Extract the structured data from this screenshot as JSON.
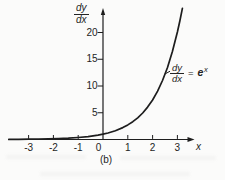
{
  "figure": {
    "caption": "(b)",
    "background": "#fbfbfa",
    "ink_color": "#1d1d1d"
  },
  "chart_data": {
    "type": "line",
    "title": "",
    "xlabel": "x",
    "ylabel_numerator": "dy",
    "ylabel_denominator": "dx",
    "x_ticks": [
      -3,
      -2,
      -1,
      0,
      1,
      2,
      3
    ],
    "y_ticks": [
      5,
      10,
      15,
      20
    ],
    "xlim": [
      -3.8,
      3.65
    ],
    "ylim": [
      0,
      24.8
    ],
    "grid": false,
    "legend": "none",
    "series": [
      {
        "name": "dy/dx = e^x",
        "points": [
          [
            -3.8,
            0.02
          ],
          [
            -3.4,
            0.03
          ],
          [
            -3.0,
            0.05
          ],
          [
            -2.6,
            0.07
          ],
          [
            -2.2,
            0.11
          ],
          [
            -1.8,
            0.17
          ],
          [
            -1.4,
            0.25
          ],
          [
            -1.0,
            0.37
          ],
          [
            -0.6,
            0.55
          ],
          [
            -0.2,
            0.82
          ],
          [
            0.0,
            1.0
          ],
          [
            0.2,
            1.22
          ],
          [
            0.5,
            1.65
          ],
          [
            0.8,
            2.23
          ],
          [
            1.0,
            2.72
          ],
          [
            1.2,
            3.32
          ],
          [
            1.4,
            4.06
          ],
          [
            1.6,
            4.95
          ],
          [
            1.8,
            6.05
          ],
          [
            2.0,
            7.39
          ],
          [
            2.2,
            9.03
          ],
          [
            2.4,
            11.02
          ],
          [
            2.6,
            13.46
          ],
          [
            2.8,
            16.44
          ],
          [
            3.0,
            20.09
          ],
          [
            3.1,
            22.2
          ],
          [
            3.2,
            24.53
          ]
        ]
      }
    ],
    "annotation": {
      "numerator": "dy",
      "denominator": "dx",
      "equals_sign": "=",
      "rhs_base": "e",
      "rhs_exponent": "x",
      "attach_point": [
        2.48,
        12.2
      ]
    }
  }
}
